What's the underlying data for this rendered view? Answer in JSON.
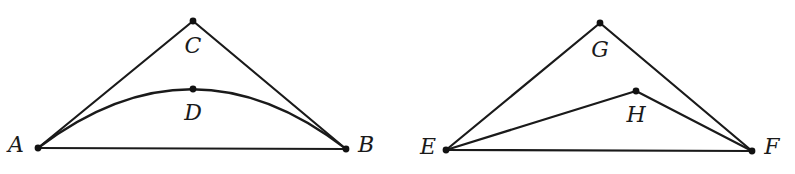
{
  "figures": [
    {
      "name": "figure-left",
      "points": {
        "A": {
          "label": "A",
          "x": 38,
          "y": 148,
          "label_x": 16,
          "label_y": 145
        },
        "B": {
          "label": "B",
          "x": 346,
          "y": 149,
          "label_x": 366,
          "label_y": 145
        },
        "C": {
          "label": "C",
          "x": 193,
          "y": 21,
          "label_x": 193,
          "label_y": 46
        },
        "D": {
          "label": "D",
          "x": 193,
          "y": 89,
          "label_x": 193,
          "label_y": 113
        }
      },
      "segments": [
        [
          "A",
          "B"
        ],
        [
          "A",
          "C"
        ],
        [
          "C",
          "B"
        ]
      ],
      "curve": {
        "from": "A",
        "through": "D",
        "to": "B",
        "control_x": 193,
        "control_y": 30
      }
    },
    {
      "name": "figure-right",
      "points": {
        "E": {
          "label": "E",
          "x": 446,
          "y": 150,
          "label_x": 428,
          "label_y": 147
        },
        "F": {
          "label": "F",
          "x": 752,
          "y": 151,
          "label_x": 772,
          "label_y": 147
        },
        "G": {
          "label": "G",
          "x": 600,
          "y": 23,
          "label_x": 600,
          "label_y": 50
        },
        "H": {
          "label": "H",
          "x": 636,
          "y": 91,
          "label_x": 636,
          "label_y": 115
        }
      },
      "segments": [
        [
          "E",
          "F"
        ],
        [
          "E",
          "G"
        ],
        [
          "G",
          "F"
        ],
        [
          "E",
          "H"
        ],
        [
          "H",
          "F"
        ]
      ]
    }
  ],
  "labels": {
    "A": "A",
    "B": "B",
    "C": "C",
    "D": "D",
    "E": "E",
    "F": "F",
    "G": "G",
    "H": "H"
  }
}
